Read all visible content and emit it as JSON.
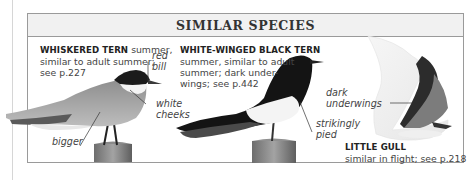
{
  "panel": {
    "title": "SIMILAR SPECIES"
  },
  "species": [
    {
      "name": "WHISKERED TERN",
      "description_lines": [
        "summer,",
        "similar to adult summer;",
        "see p.227"
      ],
      "annotations": {
        "bill": [
          "red",
          "bill"
        ],
        "cheeks": [
          "white",
          "cheeks"
        ],
        "size": "bigger"
      }
    },
    {
      "name": "WHITE-WINGED BLACK TERN",
      "description_lines": [
        "summer, similar to adult",
        "summer; dark under-",
        "wings; see p.442"
      ],
      "annotations": {
        "pattern": [
          "strikingly",
          "pied"
        ]
      }
    },
    {
      "name": "LITTLE GULL",
      "description_lines": [
        "similar in flight; see p.218"
      ],
      "annotations": {
        "underwings": [
          "dark",
          "underwings"
        ]
      }
    }
  ],
  "colors": {
    "frame": "#9a9a9a",
    "header_bg": "#f1f1f1",
    "text": "#444444"
  }
}
